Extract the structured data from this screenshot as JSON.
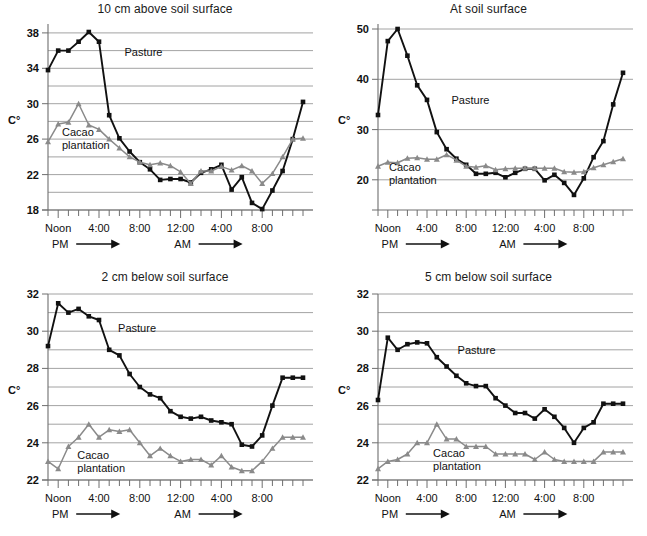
{
  "figure": {
    "series_names": [
      "Pasture",
      "Cacao plantation"
    ],
    "colors": {
      "pasture": "#111111",
      "cacao": "#8a8a8a",
      "grid": "#8c8c8c",
      "axis": "#6e6e6e"
    },
    "axis_label_y": "C°",
    "xaxis_labels": [
      "Noon",
      "4:00",
      "8:00",
      "12:00",
      "4:00",
      "8:00"
    ],
    "xaxis_label_hours": [
      12,
      16,
      20,
      24,
      28,
      32
    ],
    "period_labels": [
      "PM",
      "AM"
    ],
    "annotation_pasture": "Pasture",
    "annotation_cacao_line1": "Cacao",
    "annotation_cacao_line2": "plantation"
  },
  "chart_data": [
    {
      "id": "p1",
      "type": "line",
      "title": "10 cm above soil surface",
      "xlabel": "",
      "ylabel": "C°",
      "ylim": [
        18,
        39
      ],
      "yticks": [
        18,
        22,
        26,
        30,
        34,
        38
      ],
      "ygrid": [
        18,
        20,
        22,
        24,
        26,
        28,
        30,
        32,
        34,
        36,
        38
      ],
      "grid": true,
      "legend": "inline-annotations",
      "x": [
        11,
        12,
        13,
        14,
        15,
        16,
        17,
        18,
        19,
        20,
        21,
        22,
        23,
        24,
        25,
        26,
        27,
        28,
        29,
        30,
        31,
        32,
        33,
        34,
        35,
        36
      ],
      "xtick_hours": [
        11,
        12,
        13,
        14,
        15,
        16,
        17,
        18,
        19,
        20,
        21,
        22,
        23,
        24,
        25,
        26,
        27,
        28,
        29,
        30,
        31,
        32,
        33,
        34,
        35,
        36
      ],
      "series": [
        {
          "name": "Pasture",
          "marker": "square",
          "color": "#111111",
          "values": [
            33.8,
            36.0,
            36.0,
            37.0,
            38.1,
            37.0,
            28.7,
            26.1,
            24.6,
            23.4,
            22.6,
            21.4,
            21.5,
            21.5,
            21.1,
            22.2,
            22.6,
            23.1,
            20.3,
            21.7,
            18.8,
            18.1,
            20.2,
            22.4,
            26.0,
            30.2,
            34.1
          ]
        },
        {
          "name": "Cacao plantation",
          "marker": "triangle",
          "color": "#8a8a8a",
          "values": [
            25.7,
            27.7,
            27.9,
            30.0,
            27.6,
            27.1,
            26.0,
            25.0,
            24.0,
            23.4,
            23.1,
            23.3,
            23.0,
            22.3,
            21.0,
            22.4,
            22.4,
            22.9,
            22.5,
            23.0,
            22.4,
            21.0,
            22.1,
            24.0,
            26.0,
            26.1,
            28.1
          ]
        }
      ]
    },
    {
      "id": "p2",
      "type": "line",
      "title": "At soil surface",
      "xlabel": "",
      "ylabel": "C°",
      "ylim": [
        14,
        51
      ],
      "yticks": [
        20,
        30,
        40,
        50
      ],
      "ygrid": [
        20,
        30,
        40,
        50
      ],
      "grid": true,
      "legend": "inline-annotations",
      "x": [
        11,
        12,
        13,
        14,
        15,
        16,
        17,
        18,
        19,
        20,
        21,
        22,
        23,
        24,
        25,
        26,
        27,
        28,
        29,
        30,
        31,
        32,
        33,
        34,
        35,
        36
      ],
      "series": [
        {
          "name": "Pasture",
          "marker": "square",
          "color": "#111111",
          "values": [
            32.9,
            47.6,
            50.0,
            44.7,
            38.8,
            35.9,
            29.5,
            26.1,
            24.2,
            23.0,
            21.2,
            21.2,
            21.4,
            20.5,
            21.4,
            22.2,
            22.2,
            19.9,
            21.0,
            19.4,
            17.0,
            20.3,
            24.5,
            27.7,
            35.0,
            41.3,
            41.3
          ]
        },
        {
          "name": "Cacao plantation",
          "marker": "triangle",
          "color": "#8a8a8a",
          "values": [
            22.7,
            23.5,
            23.4,
            24.3,
            24.4,
            24.1,
            24.1,
            25.0,
            23.9,
            22.7,
            22.5,
            22.8,
            22.0,
            22.2,
            22.3,
            22.3,
            22.3,
            22.3,
            22.3,
            21.6,
            21.5,
            21.6,
            22.4,
            23.0,
            23.6,
            24.2,
            24.2
          ]
        }
      ]
    },
    {
      "id": "p3",
      "type": "line",
      "title": "2 cm below soil surface",
      "xlabel": "",
      "ylabel": "C°",
      "ylim": [
        22,
        32
      ],
      "yticks": [
        22,
        24,
        26,
        28,
        30,
        32
      ],
      "ygrid": [
        22,
        23,
        24,
        25,
        26,
        27,
        28,
        29,
        30,
        31,
        32
      ],
      "grid": true,
      "legend": "inline-annotations",
      "x": [
        11,
        12,
        13,
        14,
        15,
        16,
        17,
        18,
        19,
        20,
        21,
        22,
        23,
        24,
        25,
        26,
        27,
        28,
        29,
        30,
        31,
        32,
        33,
        34,
        35,
        36
      ],
      "series": [
        {
          "name": "Pasture",
          "marker": "square",
          "color": "#111111",
          "values": [
            29.2,
            31.5,
            31.0,
            31.2,
            30.8,
            30.6,
            29.0,
            28.7,
            27.7,
            27.0,
            26.6,
            26.4,
            25.7,
            25.4,
            25.3,
            25.4,
            25.2,
            25.1,
            25.0,
            23.9,
            23.8,
            24.4,
            26.0,
            27.5,
            27.5,
            27.5,
            27.5
          ]
        },
        {
          "name": "Cacao plantation",
          "marker": "triangle",
          "color": "#8a8a8a",
          "values": [
            23.0,
            22.6,
            23.8,
            24.3,
            25.0,
            24.3,
            24.7,
            24.6,
            24.7,
            24.0,
            23.3,
            23.7,
            23.3,
            23.0,
            23.1,
            23.1,
            22.8,
            23.3,
            22.7,
            22.5,
            22.5,
            23.0,
            23.7,
            24.3,
            24.3,
            24.3,
            24.3
          ]
        }
      ]
    },
    {
      "id": "p4",
      "type": "line",
      "title": "5 cm below soil surface",
      "xlabel": "",
      "ylabel": "C°",
      "ylim": [
        22,
        32
      ],
      "yticks": [
        22,
        24,
        26,
        28,
        30,
        32
      ],
      "ygrid": [
        22,
        23,
        24,
        25,
        26,
        27,
        28,
        29,
        30,
        31,
        32
      ],
      "grid": true,
      "legend": "inline-annotations",
      "x": [
        11,
        12,
        13,
        14,
        15,
        16,
        17,
        18,
        19,
        20,
        21,
        22,
        23,
        24,
        25,
        26,
        27,
        28,
        29,
        30,
        31,
        32,
        33,
        34,
        35,
        36
      ],
      "series": [
        {
          "name": "Pasture",
          "marker": "square",
          "color": "#111111",
          "values": [
            26.3,
            29.65,
            29.0,
            29.3,
            29.4,
            29.35,
            28.6,
            28.1,
            27.6,
            27.2,
            27.05,
            27.05,
            26.4,
            26.0,
            25.6,
            25.6,
            25.3,
            25.8,
            25.4,
            24.8,
            24.0,
            24.8,
            25.1,
            26.1,
            26.1,
            26.1,
            26.1
          ]
        },
        {
          "name": "Cacao plantation",
          "marker": "triangle",
          "color": "#8a8a8a",
          "values": [
            22.6,
            23.0,
            23.1,
            23.4,
            24.0,
            24.0,
            25.0,
            24.2,
            24.2,
            23.8,
            23.8,
            23.8,
            23.4,
            23.4,
            23.4,
            23.4,
            23.1,
            23.5,
            23.1,
            23.0,
            23.0,
            23.0,
            23.0,
            23.5,
            23.5,
            23.5,
            23.5
          ]
        }
      ]
    }
  ]
}
